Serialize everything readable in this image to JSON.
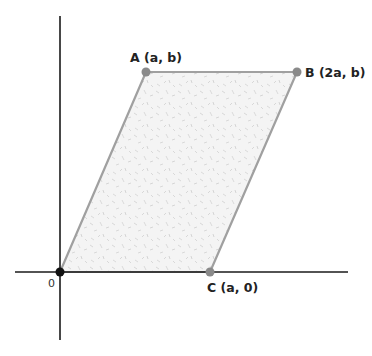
{
  "diagram": {
    "type": "parallelogram-on-coordinate-plane",
    "colors": {
      "axis": "#1a1a1a",
      "edge": "#9a9a9a",
      "fill": "#f3f3f3",
      "texture": "#c8c8c8",
      "vertex": "#8a8a8a",
      "origin_point": "#111111",
      "label": "#222222"
    },
    "origin": {
      "label": "0"
    },
    "points": [
      {
        "id": "A",
        "label": "A (a, b)"
      },
      {
        "id": "B",
        "label": "B (2a, b)"
      },
      {
        "id": "C",
        "label": "C (a, 0)"
      }
    ]
  }
}
